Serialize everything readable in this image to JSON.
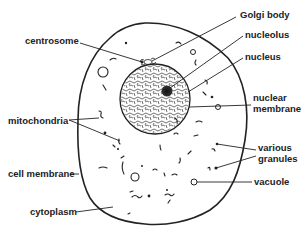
{
  "diagram": {
    "type": "labeled-illustration",
    "labels": {
      "golgi_body": "Golgi body",
      "centrosome": "centrosome",
      "nucleolus": "nucleolus",
      "nucleus": "nucleus",
      "nuclear_membrane_1": "nuclear",
      "nuclear_membrane_2": "membrane",
      "mitochondria": "mitochondria",
      "various_granules_1": "various",
      "various_granules_2": "granules",
      "cell_membrane": "cell membrane",
      "vacuole": "vacuole",
      "cytoplasm": "cytoplasm"
    },
    "colors": {
      "ink": "#222222",
      "background": "#ffffff"
    }
  }
}
